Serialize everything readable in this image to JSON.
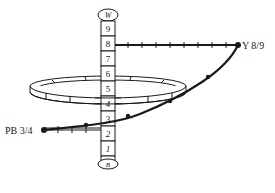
{
  "diagram": {
    "type": "munsell-color-solid-path",
    "value_axis": {
      "top_label": "W",
      "bottom_label": "B",
      "steps": [
        "9",
        "8",
        "7",
        "6",
        "5",
        "4",
        "3",
        "2",
        "1"
      ]
    },
    "endpoints": {
      "top": {
        "label": "Y 8/9",
        "value_level": "8"
      },
      "bottom": {
        "label": "PB 3/4",
        "value_level": "3"
      }
    },
    "colors": {
      "ink": "#1a1a1a",
      "background": "#ffffff"
    }
  }
}
